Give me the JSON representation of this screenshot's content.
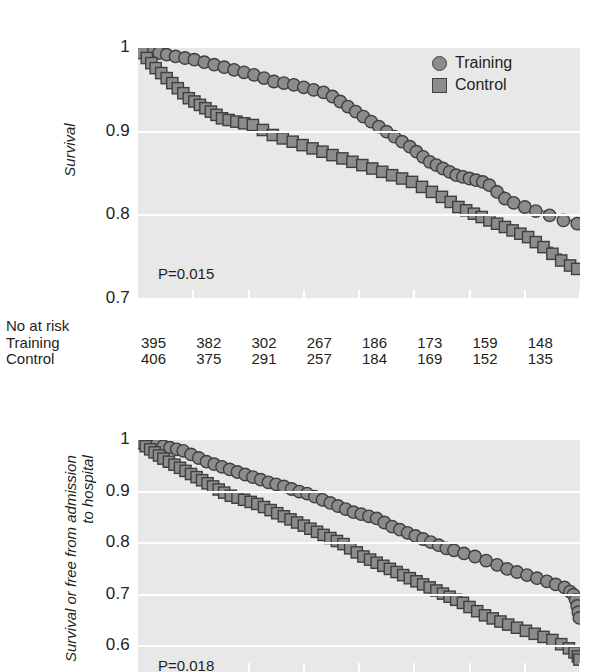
{
  "figure": {
    "background_color": "#ffffff",
    "plot_background_color": "#e8e8e8",
    "gridline_color": "#ffffff",
    "marker_fill_color": "#8c8c8c",
    "marker_edge_color": "#3f3f3f",
    "text_color": "#231f20"
  },
  "legend": {
    "position": "top-right",
    "items": [
      {
        "label": "Training",
        "marker": "circle-marker"
      },
      {
        "label": "Control",
        "marker": "square-marker"
      }
    ]
  },
  "at_risk": {
    "header": "No at risk",
    "rows": [
      {
        "label": "Training",
        "values": [
          395,
          382,
          302,
          267,
          186,
          173,
          159,
          148
        ]
      },
      {
        "label": "Control",
        "values": [
          406,
          375,
          291,
          257,
          184,
          169,
          152,
          135
        ]
      }
    ]
  },
  "chart_data": [
    {
      "id": "survival-chart",
      "type": "line",
      "title": "",
      "xlabel": "",
      "ylabel": "Survival",
      "ylabel_lines": [
        "Survival"
      ],
      "ylim": [
        0.7,
        1.0
      ],
      "yticks": [
        1,
        0.9,
        0.8,
        0.7
      ],
      "ytick_labels": [
        "1",
        "0.9",
        "0.8",
        "0.7"
      ],
      "xlim": [
        0,
        8
      ],
      "xticks": [
        0,
        1,
        2,
        3,
        4,
        5,
        6,
        7,
        8
      ],
      "xtick_labels": [
        "",
        "",
        "",
        "",
        "",
        "",
        "",
        "",
        ""
      ],
      "grid": true,
      "legend_position": "top-right",
      "annotations": [
        {
          "text": "P=0.015",
          "x": 0.35,
          "y": 0.735
        }
      ],
      "series": [
        {
          "name": "Training",
          "marker": "circle-marker",
          "x": [
            0.0,
            0.12,
            0.25,
            0.38,
            0.52,
            0.68,
            0.85,
            1.02,
            1.2,
            1.38,
            1.56,
            1.74,
            1.92,
            2.1,
            2.28,
            2.46,
            2.64,
            2.82,
            3.0,
            3.18,
            3.36,
            3.52,
            3.66,
            3.8,
            3.94,
            4.08,
            4.22,
            4.36,
            4.5,
            4.64,
            4.78,
            4.92,
            5.04,
            5.16,
            5.28,
            5.4,
            5.52,
            5.64,
            5.76,
            5.88,
            6.0,
            6.12,
            6.24,
            6.36,
            6.5,
            6.64,
            6.8,
            7.0,
            7.2,
            7.45,
            7.7,
            7.95
          ],
          "y": [
            1.0,
            0.998,
            0.996,
            0.994,
            0.992,
            0.99,
            0.988,
            0.986,
            0.983,
            0.98,
            0.977,
            0.974,
            0.971,
            0.968,
            0.964,
            0.96,
            0.958,
            0.956,
            0.953,
            0.95,
            0.947,
            0.942,
            0.936,
            0.93,
            0.924,
            0.918,
            0.912,
            0.906,
            0.9,
            0.894,
            0.888,
            0.882,
            0.876,
            0.87,
            0.864,
            0.86,
            0.856,
            0.852,
            0.848,
            0.846,
            0.844,
            0.842,
            0.84,
            0.836,
            0.828,
            0.82,
            0.815,
            0.81,
            0.805,
            0.8,
            0.794,
            0.79
          ]
        },
        {
          "name": "Control",
          "marker": "square-marker",
          "x": [
            0.0,
            0.08,
            0.16,
            0.24,
            0.32,
            0.42,
            0.52,
            0.62,
            0.72,
            0.82,
            0.92,
            1.02,
            1.12,
            1.22,
            1.32,
            1.42,
            1.52,
            1.64,
            1.78,
            1.92,
            2.08,
            2.26,
            2.44,
            2.62,
            2.8,
            2.98,
            3.16,
            3.34,
            3.52,
            3.7,
            3.88,
            4.06,
            4.24,
            4.42,
            4.6,
            4.78,
            4.96,
            5.14,
            5.32,
            5.5,
            5.66,
            5.8,
            5.94,
            6.08,
            6.22,
            6.36,
            6.5,
            6.64,
            6.78,
            6.92,
            7.06,
            7.2,
            7.34,
            7.5,
            7.66,
            7.82,
            7.95
          ],
          "y": [
            1.0,
            0.994,
            0.988,
            0.982,
            0.976,
            0.97,
            0.964,
            0.958,
            0.952,
            0.946,
            0.94,
            0.936,
            0.932,
            0.928,
            0.924,
            0.92,
            0.916,
            0.914,
            0.912,
            0.91,
            0.908,
            0.902,
            0.896,
            0.892,
            0.888,
            0.884,
            0.88,
            0.876,
            0.872,
            0.868,
            0.864,
            0.86,
            0.856,
            0.852,
            0.848,
            0.844,
            0.84,
            0.834,
            0.828,
            0.822,
            0.816,
            0.81,
            0.806,
            0.802,
            0.798,
            0.794,
            0.79,
            0.786,
            0.782,
            0.778,
            0.774,
            0.768,
            0.762,
            0.754,
            0.746,
            0.74,
            0.736
          ]
        }
      ]
    },
    {
      "id": "survival-free-admission-chart",
      "type": "line",
      "title": "",
      "xlabel": "",
      "ylabel": "Survival or free from admission to hospital",
      "ylabel_lines": [
        "Survival or free from admission",
        "to hospital"
      ],
      "ylim": [
        0.55,
        1.0
      ],
      "yticks": [
        1,
        0.9,
        0.8,
        0.7,
        0.6
      ],
      "ytick_labels": [
        "1",
        "0.9",
        "0.8",
        "0.7",
        "0.6"
      ],
      "xlim": [
        0,
        8
      ],
      "xticks": [
        0,
        1,
        2,
        3,
        4,
        5,
        6,
        7,
        8
      ],
      "xtick_labels": [
        "",
        "",
        "",
        "",
        "",
        "",
        "",
        "",
        ""
      ],
      "grid": true,
      "legend_position": "none",
      "annotations": [
        {
          "text": "P=0.018",
          "x": 0.35,
          "y": 0.565
        }
      ],
      "series": [
        {
          "name": "Training",
          "marker": "circle-marker",
          "x": [
            0.0,
            0.1,
            0.22,
            0.34,
            0.46,
            0.58,
            0.7,
            0.82,
            0.96,
            1.1,
            1.24,
            1.38,
            1.52,
            1.66,
            1.8,
            1.94,
            2.08,
            2.22,
            2.36,
            2.5,
            2.64,
            2.78,
            2.92,
            3.06,
            3.2,
            3.34,
            3.48,
            3.62,
            3.76,
            3.9,
            4.04,
            4.18,
            4.32,
            4.46,
            4.6,
            4.74,
            4.88,
            5.02,
            5.16,
            5.3,
            5.44,
            5.58,
            5.72,
            5.9,
            6.1,
            6.3,
            6.5,
            6.68,
            6.86,
            7.04,
            7.22,
            7.4,
            7.56,
            7.72,
            7.82,
            7.88,
            7.92,
            7.95,
            7.97,
            7.99
          ],
          "y": [
            1.0,
            0.997,
            0.994,
            0.991,
            0.988,
            0.985,
            0.982,
            0.979,
            0.972,
            0.965,
            0.958,
            0.953,
            0.948,
            0.943,
            0.938,
            0.933,
            0.928,
            0.923,
            0.918,
            0.914,
            0.91,
            0.905,
            0.9,
            0.896,
            0.89,
            0.884,
            0.878,
            0.872,
            0.866,
            0.86,
            0.856,
            0.852,
            0.848,
            0.84,
            0.832,
            0.826,
            0.82,
            0.814,
            0.808,
            0.802,
            0.796,
            0.79,
            0.786,
            0.78,
            0.774,
            0.766,
            0.758,
            0.75,
            0.744,
            0.738,
            0.732,
            0.726,
            0.72,
            0.714,
            0.706,
            0.7,
            0.69,
            0.678,
            0.666,
            0.655
          ]
        },
        {
          "name": "Control",
          "marker": "square-marker",
          "x": [
            0.0,
            0.06,
            0.14,
            0.22,
            0.3,
            0.38,
            0.46,
            0.56,
            0.66,
            0.76,
            0.86,
            0.96,
            1.06,
            1.16,
            1.26,
            1.36,
            1.46,
            1.56,
            1.68,
            1.8,
            1.92,
            2.04,
            2.16,
            2.28,
            2.4,
            2.52,
            2.64,
            2.76,
            2.88,
            3.0,
            3.12,
            3.24,
            3.36,
            3.48,
            3.6,
            3.72,
            3.84,
            3.96,
            4.08,
            4.2,
            4.32,
            4.44,
            4.56,
            4.68,
            4.8,
            4.92,
            5.04,
            5.16,
            5.28,
            5.4,
            5.52,
            5.64,
            5.76,
            5.88,
            6.0,
            6.14,
            6.28,
            6.42,
            6.56,
            6.7,
            6.86,
            7.02,
            7.18,
            7.34,
            7.5,
            7.66,
            7.8,
            7.9,
            7.96,
            7.99
          ],
          "y": [
            1.0,
            0.994,
            0.988,
            0.982,
            0.976,
            0.97,
            0.964,
            0.958,
            0.952,
            0.946,
            0.94,
            0.934,
            0.928,
            0.922,
            0.916,
            0.91,
            0.904,
            0.898,
            0.892,
            0.888,
            0.884,
            0.88,
            0.876,
            0.87,
            0.864,
            0.858,
            0.852,
            0.846,
            0.84,
            0.834,
            0.828,
            0.822,
            0.816,
            0.81,
            0.804,
            0.798,
            0.79,
            0.782,
            0.774,
            0.768,
            0.762,
            0.756,
            0.75,
            0.744,
            0.738,
            0.732,
            0.726,
            0.72,
            0.714,
            0.708,
            0.702,
            0.696,
            0.69,
            0.684,
            0.676,
            0.668,
            0.66,
            0.654,
            0.648,
            0.642,
            0.636,
            0.63,
            0.624,
            0.618,
            0.612,
            0.604,
            0.596,
            0.588,
            0.58,
            0.574
          ]
        }
      ]
    }
  ]
}
